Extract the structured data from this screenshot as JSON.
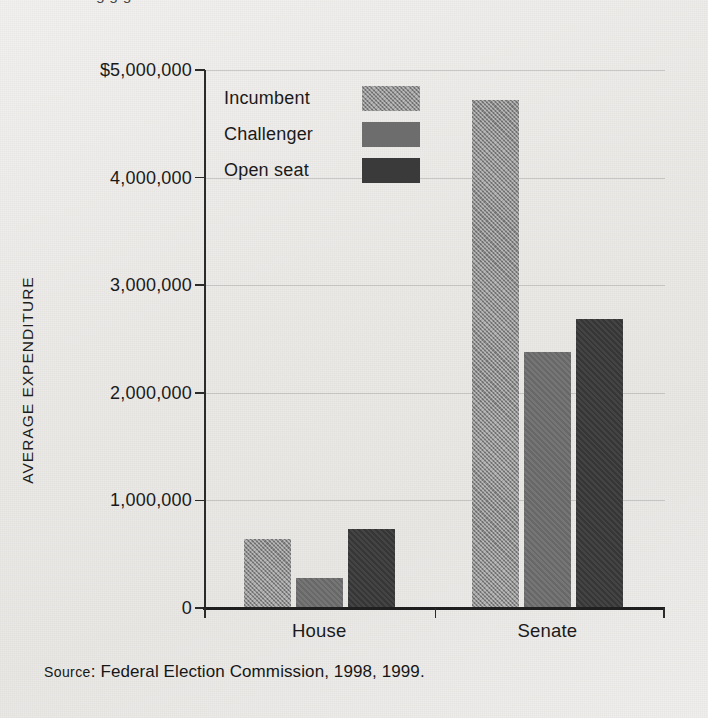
{
  "figure": {
    "top_cut_text": "g                                g        g",
    "source_prefix": "Source",
    "source_text": ": Federal Election Commission, 1998, 1999."
  },
  "legend": {
    "items": [
      {
        "label": "Incumbent",
        "color": "#898989",
        "key": "incumbent"
      },
      {
        "label": "Challenger",
        "color": "#6d6d6d",
        "key": "challenger"
      },
      {
        "label": "Open seat",
        "color": "#3a3a3a",
        "key": "openseat"
      }
    ]
  },
  "chart_data": {
    "type": "bar",
    "title": "",
    "xlabel": "",
    "ylabel": "AVERAGE EXPENDITURE",
    "categories": [
      "House",
      "Senate"
    ],
    "series": [
      {
        "name": "Incumbent",
        "color": "#898989",
        "values": [
          640000,
          4720000
        ]
      },
      {
        "name": "Challenger",
        "color": "#6d6d6d",
        "values": [
          275000,
          2380000
        ]
      },
      {
        "name": "Open seat",
        "color": "#3a3a3a",
        "values": [
          730000,
          2690000
        ]
      }
    ],
    "ylim": [
      0,
      5000000
    ],
    "ytick_values": [
      5000000,
      4000000,
      3000000,
      2000000,
      1000000,
      0
    ],
    "ytick_labels": [
      "$5,000,000",
      "4,000,000",
      "3,000,000",
      "2,000,000",
      "1,000,000",
      "0"
    ],
    "grid": true,
    "legend_position": "inside-top-left"
  }
}
